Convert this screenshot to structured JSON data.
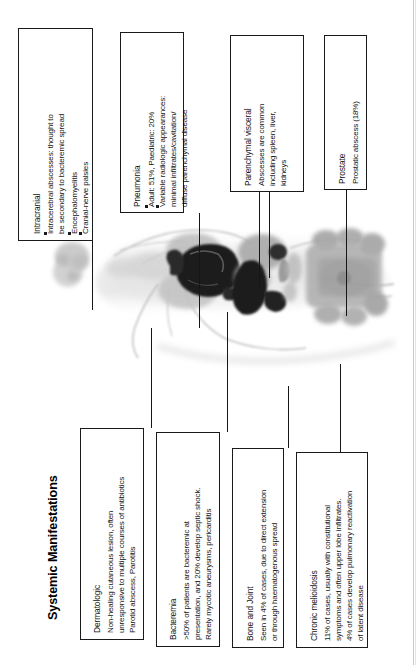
{
  "figure": {
    "title": "Systemic Manifestations",
    "orientation": "rotated-90-ccw",
    "artwork_name": "whole-body-scan-illustration"
  },
  "callouts": [
    {
      "id": "intracranial",
      "heading": "Intracranial",
      "bullets": [
        "Intracerebral abscesses: thought to",
        "be secondary to bacteremic spread",
        "Encephalomyelitis",
        "Cranial-nerve palsies"
      ],
      "lines": [
        "Intracranial",
        "Intracerebral abscesses: thought to",
        "be secondary to bacteremic spread",
        "Encephalomyelitis",
        "Cranial-nerve palsies"
      ],
      "target": "brain"
    },
    {
      "id": "pneumonia",
      "heading": "Pneumonia",
      "bullets": [
        "Adult: 51%, Paediatric: 20%",
        "Variable radiologic appearances:",
        "minimal infiltrates/cavitation/",
        "diffuse parenchymal disease"
      ],
      "lines": [
        "Pneumonia",
        "Adult: 51%, Paediatric: 20%",
        "Variable radiologic appearances:",
        "minimal infiltrates/cavitation/",
        "diffuse parenchymal disease"
      ],
      "target": "lungs"
    },
    {
      "id": "parenchymal-visceral",
      "heading": "Parenchymal visceral",
      "lines": [
        "Parenchymal visceral",
        "Abscesses are common",
        "including spleen, liver,",
        "kidneys"
      ],
      "target": "spleen-liver-kidneys"
    },
    {
      "id": "prostate",
      "heading": "Prostate",
      "lines": [
        "Prostate",
        "Prostatic abscess (18%)"
      ],
      "target": "prostate"
    },
    {
      "id": "dermatologic",
      "heading": "Dermatologic",
      "lines": [
        "Dermatologic",
        "Non-healing cutaneous lesion, often",
        "unresponsive to multiple courses of antibiotics",
        "Parotid abscess, Parotitis"
      ],
      "target": "head-skin"
    },
    {
      "id": "bacteremia",
      "heading": "Bacteremia",
      "lines": [
        "Bacteremia",
        ">50% of patients are bacteremic at",
        "presentation, and 20% develop septic shock.",
        "Rarely mycotic aneurysms, pericarditis"
      ],
      "target": "heart"
    },
    {
      "id": "bone-and-joint",
      "heading": "Bone and Joint",
      "lines": [
        "Bone and Joint",
        "Seen in 4% of cases, due to direct extension",
        "or through haematogenous spread"
      ],
      "target": "skeleton"
    },
    {
      "id": "chronic-melioidosis",
      "heading": "Chronic melioidosis",
      "lines": [
        "Chronic melioidosis",
        "11% of cases, usually with constitutional",
        "symptoms and often upper lobe infiltrates.",
        "4% of cases develop pulmonary reactivation",
        "of latent disease"
      ],
      "target": "abdomen"
    }
  ],
  "colors": {
    "line": "#161616",
    "box_border": "#1a1a1a",
    "text": "#141414",
    "background": "#ffffff",
    "scan_light": "#d6d6d6",
    "scan_mid": "#a8a8a8",
    "scan_dark": "#5e5e5e",
    "scan_lesion": "#1d1d1d"
  }
}
